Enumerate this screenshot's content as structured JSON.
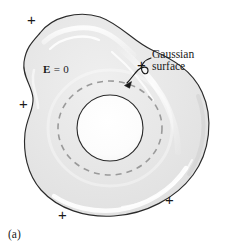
{
  "figure": {
    "caption": "(a)",
    "labels": {
      "field_symbol": "E",
      "field_relation": "= 0",
      "gaussian_line1": "Gaussian",
      "gaussian_line2": "surface"
    },
    "charges": [
      {
        "symbol": "+",
        "x": 27,
        "y": 12
      },
      {
        "symbol": "+",
        "x": 137,
        "y": 57
      },
      {
        "symbol": "+",
        "x": 19,
        "y": 96
      },
      {
        "symbol": "+",
        "x": 165,
        "y": 192
      },
      {
        "symbol": "+",
        "x": 58,
        "y": 207
      }
    ],
    "colors": {
      "outline": "#2b2b2b",
      "body_fill": "#e8e8e8",
      "cavity_fill": "#fbfbfb",
      "gaussian_dash": "#9a9a9a",
      "highlight": "#ffffff",
      "background": "#ffffff",
      "text": "#1a1a1a"
    },
    "geometry": {
      "cavity_center_x": 110,
      "cavity_center_y": 128,
      "cavity_radius": 33,
      "gaussian_radius_x": 52,
      "gaussian_radius_y": 47
    }
  }
}
